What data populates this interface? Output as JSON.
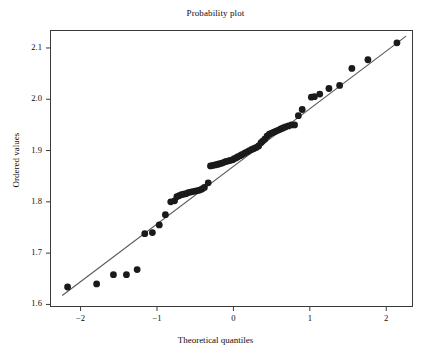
{
  "chart_data": {
    "type": "scatter",
    "title": "Probability plot",
    "xlabel": "Theoretical quantiles",
    "ylabel": "Ordered values",
    "xlim": [
      -2.4,
      2.35
    ],
    "ylim": [
      1.595,
      2.135
    ],
    "xticks": [
      -2,
      -1,
      0,
      1,
      2
    ],
    "xtick_labels": [
      "−2",
      "−1",
      "0",
      "1",
      "2"
    ],
    "yticks": [
      1.6,
      1.7,
      1.8,
      1.9,
      2.0,
      2.1
    ],
    "ytick_labels": [
      "1.6",
      "1.7",
      "1.8",
      "1.9",
      "2.0",
      "2.1"
    ],
    "grid": false,
    "legend": false,
    "marker_color": "#1a1a1a",
    "line_color": "#5a5a5a",
    "frame_color": "#3a3a3a",
    "background": "#ffffff",
    "series": [
      {
        "name": "ordered values",
        "marker": "filled-circle",
        "x": [
          -2.17,
          -1.79,
          -1.57,
          -1.4,
          -1.26,
          -1.16,
          -1.06,
          -0.97,
          -0.89,
          -0.82,
          -0.77,
          -0.74,
          -0.71,
          -0.68,
          -0.65,
          -0.62,
          -0.59,
          -0.56,
          -0.53,
          -0.5,
          -0.47,
          -0.44,
          -0.41,
          -0.38,
          -0.33,
          -0.3,
          -0.27,
          -0.24,
          -0.21,
          -0.19,
          -0.16,
          -0.14,
          -0.11,
          -0.09,
          -0.06,
          -0.04,
          -0.01,
          0.01,
          0.04,
          0.06,
          0.09,
          0.11,
          0.14,
          0.16,
          0.19,
          0.21,
          0.24,
          0.27,
          0.3,
          0.33,
          0.36,
          0.38,
          0.41,
          0.44,
          0.47,
          0.5,
          0.53,
          0.56,
          0.59,
          0.62,
          0.65,
          0.68,
          0.72,
          0.76,
          0.8,
          0.85,
          0.9,
          1.02,
          1.06,
          1.13,
          1.25,
          1.39,
          1.55,
          1.76,
          2.14
        ],
        "y": [
          1.634,
          1.64,
          1.658,
          1.658,
          1.668,
          1.738,
          1.74,
          1.755,
          1.775,
          1.8,
          1.802,
          1.81,
          1.812,
          1.814,
          1.815,
          1.816,
          1.818,
          1.819,
          1.82,
          1.821,
          1.822,
          1.823,
          1.825,
          1.828,
          1.837,
          1.87,
          1.871,
          1.872,
          1.873,
          1.874,
          1.875,
          1.876,
          1.878,
          1.879,
          1.88,
          1.881,
          1.882,
          1.884,
          1.886,
          1.888,
          1.89,
          1.892,
          1.894,
          1.896,
          1.898,
          1.9,
          1.902,
          1.904,
          1.906,
          1.909,
          1.915,
          1.918,
          1.922,
          1.928,
          1.932,
          1.934,
          1.936,
          1.938,
          1.94,
          1.942,
          1.944,
          1.946,
          1.948,
          1.95,
          1.95,
          1.968,
          1.98,
          2.004,
          2.005,
          2.01,
          2.021,
          2.027,
          2.06,
          2.077,
          2.11
        ]
      }
    ],
    "reference_line": {
      "name": "fit-line",
      "x0": -2.24,
      "y0": 1.6175,
      "x1": 2.26,
      "y1": 2.123
    }
  }
}
